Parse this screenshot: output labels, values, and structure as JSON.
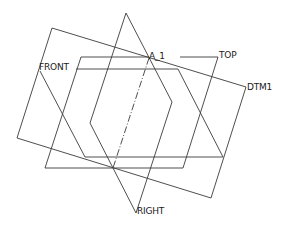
{
  "view": {
    "background": "#ffffff",
    "line_color": "#3a3a3a"
  },
  "datum_planes": [
    {
      "name": "DTM1",
      "label": "DTM1",
      "points": [
        [
          52,
          28
        ],
        [
          246,
          87
        ],
        [
          211,
          198
        ],
        [
          17,
          138
        ]
      ],
      "label_pos": [
        247,
        81
      ]
    },
    {
      "name": "TOP",
      "label": "TOP",
      "points": [
        [
          81,
          57
        ],
        [
          218,
          57
        ],
        [
          183,
          168
        ],
        [
          45,
          168
        ]
      ],
      "label_pos": [
        219,
        50
      ]
    },
    {
      "name": "FRONT",
      "label": "FRONT",
      "points": [
        [
          76,
          69
        ],
        [
          178,
          69
        ],
        [
          223,
          157
        ],
        [
          85,
          157
        ],
        [
          40,
          71
        ]
      ],
      "label_pos": [
        40,
        62
      ]
    },
    {
      "name": "RIGHT",
      "label": "RIGHT",
      "points": [
        [
          126,
          13
        ],
        [
          172,
          102
        ],
        [
          136,
          213
        ],
        [
          113,
          168
        ],
        [
          90,
          123
        ]
      ],
      "label_pos": [
        137,
        206
      ]
    }
  ],
  "axes": [
    {
      "name": "A_1",
      "label": "A_1",
      "from": [
        149,
        58
      ],
      "to": [
        113,
        168
      ],
      "label_pos": [
        150,
        50
      ]
    }
  ],
  "labels": {
    "dtm1": "DTM1",
    "top": "TOP",
    "front": "FRONT",
    "right": "RIGHT",
    "axis": "A_1"
  }
}
